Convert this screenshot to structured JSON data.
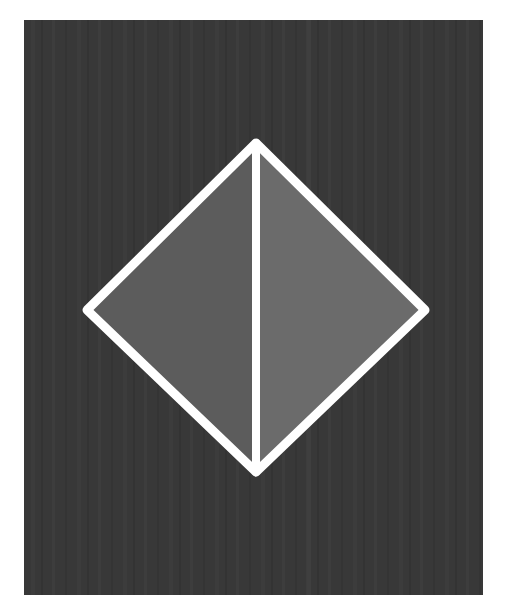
{
  "image": {
    "width": 505,
    "height": 597,
    "page_background": "#ffffff"
  },
  "panel": {
    "x": 24,
    "y": 20,
    "width": 459,
    "height": 575,
    "color": "#383838",
    "streak_color": "#3f3f3f"
  },
  "diamond": {
    "top": [
      256,
      143
    ],
    "right": [
      425,
      310
    ],
    "bottom": [
      256,
      472
    ],
    "left": [
      87,
      310
    ],
    "stroke_color": "#ffffff",
    "stroke_width": 9,
    "left_fill": "#5c5c5c",
    "right_fill": "#6b6b6b",
    "divider_width": 8
  }
}
